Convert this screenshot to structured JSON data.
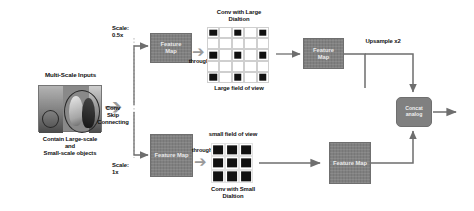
{
  "diagram": {
    "type": "flow-diagram",
    "colors": {
      "feature_map_fill": "#808080",
      "grid_active_cell": "#111111",
      "grid_line": "#cfcfcf",
      "arrow": "#6e6e6e",
      "block_arrow": "#9a9a9a",
      "text": "#111111",
      "background": "#ffffff"
    },
    "input": {
      "title": "Multi-Scale Inputs",
      "caption": "Contain Large-scale\nand\nSmall-scale objects",
      "photo_alt": "grayscale wedding photo with two figures circled"
    },
    "skip": {
      "label": "Conv\nSkip\nConnecting"
    },
    "branches": {
      "top": {
        "scale_label": "Scale:\n0.5x",
        "feature_map_in": "Feature\nMap",
        "through_label": "through",
        "conv_title": "Conv with Large\nDialtion",
        "field_label": "Large field of view",
        "feature_map_out": "Feature\nMap",
        "upsample_label": "Upsample x2",
        "grid": {
          "rows": 5,
          "cols": 5,
          "active_cells": [
            [
              0,
              0
            ],
            [
              0,
              2
            ],
            [
              0,
              4
            ],
            [
              2,
              0
            ],
            [
              2,
              2
            ],
            [
              2,
              4
            ],
            [
              4,
              0
            ],
            [
              4,
              2
            ],
            [
              4,
              4
            ]
          ]
        }
      },
      "bottom": {
        "scale_label": "Scale:\n1x",
        "feature_map_in": "Feature Map",
        "through_label": "through",
        "conv_title": "Conv with Small\nDialtion",
        "field_label": "small field of view",
        "feature_map_out": "Feature Map",
        "grid": {
          "rows": 3,
          "cols": 3,
          "active_cells": [
            [
              0,
              0
            ],
            [
              0,
              1
            ],
            [
              0,
              2
            ],
            [
              1,
              0
            ],
            [
              1,
              1
            ],
            [
              1,
              2
            ],
            [
              2,
              0
            ],
            [
              2,
              1
            ],
            [
              2,
              2
            ]
          ]
        }
      }
    },
    "merge": {
      "label": "Concat\nanalog"
    }
  }
}
